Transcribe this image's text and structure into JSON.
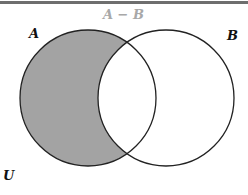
{
  "diagram": {
    "type": "venn",
    "title": "A − B",
    "sets": [
      {
        "label": "A",
        "cx": 88,
        "cy": 98,
        "r": 68
      },
      {
        "label": "B",
        "cx": 166,
        "cy": 98,
        "r": 68
      }
    ],
    "universe_label": "U",
    "shaded_region": "A − B",
    "colors": {
      "shade": "#a3a3a3",
      "stroke": "#222222",
      "title": "#a8a8a8",
      "label": "#111111",
      "border": "#6e6e6e"
    }
  }
}
